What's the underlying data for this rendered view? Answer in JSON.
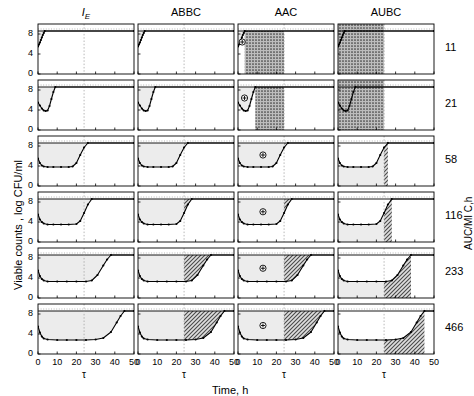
{
  "figure": {
    "axis_x_title": "Time, h",
    "axis_y_title": "Viable counts , log CFU/ml",
    "axis_right_title": "AUC/MI C,h",
    "tau_symbol": "τ",
    "tau_value": 24,
    "xlim": [
      0,
      50
    ],
    "ylim": [
      0,
      10
    ],
    "x_ticks": [
      0,
      10,
      20,
      30,
      40,
      50
    ],
    "y_ticks": [
      0,
      4,
      8
    ],
    "control_level": 8.6,
    "colors": {
      "curve": "#000000",
      "light_fill": "#ececec",
      "hatch_fill": "#a8a8a8",
      "dense_fill": "#909090",
      "axis": "#000000",
      "grid": "#9a9a9a",
      "background": "#ffffff"
    }
  },
  "columns": [
    {
      "id": "IE",
      "label": "I",
      "sub": "E",
      "italic": true,
      "metric": "intensity-of-effect"
    },
    {
      "id": "ABBC",
      "label": "ABBC",
      "sub": "",
      "italic": false,
      "metric": "area-between-bacterial-curves"
    },
    {
      "id": "AAC",
      "label": "AAC",
      "sub": "",
      "italic": false,
      "metric": "area-above-curve"
    },
    {
      "id": "AUBC",
      "label": "AUBC",
      "sub": "",
      "italic": false,
      "metric": "area-under-bacterial-curve"
    }
  ],
  "rows": [
    {
      "label": "11"
    },
    {
      "label": "21"
    },
    {
      "label": "58"
    },
    {
      "label": "116"
    },
    {
      "label": "233"
    },
    {
      "label": "466"
    }
  ],
  "chart_data": {
    "type": "line",
    "title": "",
    "xlabel": "Time, h",
    "ylabel": "Viable counts , log CFU/ml",
    "right_label": "AUC/MI C,h",
    "xlim": [
      0,
      50
    ],
    "ylim": [
      0,
      10
    ],
    "x_ticks": [
      0,
      10,
      20,
      30,
      40,
      50
    ],
    "y_ticks": [
      0,
      4,
      8
    ],
    "grid": "tau-line-only",
    "legend": "none",
    "tau": 24,
    "control_line_y": 8.6,
    "panel_columns": [
      "I_E",
      "ABBC",
      "AAC",
      "AUBC"
    ],
    "panel_rows": [
      "11",
      "21",
      "58",
      "116",
      "233",
      "466"
    ],
    "series": [
      {
        "name": "AUC/MIC 11",
        "x": [
          0,
          0.5,
          1,
          1.5,
          2,
          2.5,
          3,
          3.5,
          50
        ],
        "values": [
          5.5,
          5.9,
          6.3,
          6.8,
          7.3,
          7.8,
          8.2,
          8.6,
          8.6
        ],
        "nadir": 5.5,
        "nadir_time": 0,
        "regrowth_time": 3.5,
        "shade_start": 0,
        "shade_end": 3.5,
        "aac_end": 24,
        "aubc_end": 24
      },
      {
        "name": "AUC/MIC 21",
        "x": [
          0,
          1,
          2,
          3,
          4,
          5,
          6,
          7,
          8,
          9,
          50
        ],
        "values": [
          5.5,
          4.9,
          4.3,
          3.9,
          3.8,
          3.9,
          4.8,
          6.2,
          7.6,
          8.6,
          8.6
        ],
        "nadir": 3.8,
        "nadir_time": 4,
        "regrowth_time": 9,
        "shade_start": 0,
        "shade_end": 9,
        "aac_end": 24,
        "aubc_end": 24
      },
      {
        "name": "AUC/MIC 58",
        "x": [
          0,
          1,
          2,
          3,
          5,
          8,
          12,
          16,
          18,
          20,
          22,
          24,
          26,
          50
        ],
        "values": [
          5.5,
          4.6,
          4.1,
          3.9,
          3.8,
          3.8,
          3.8,
          3.8,
          3.9,
          4.6,
          6.2,
          7.7,
          8.6,
          8.6
        ],
        "nadir": 3.8,
        "nadir_time": 12,
        "regrowth_time": 26,
        "shade_start": 0,
        "shade_end": 26,
        "aac_end": 24,
        "aubc_end": 24
      },
      {
        "name": "AUC/MIC 116",
        "x": [
          0,
          1,
          2,
          3,
          5,
          8,
          12,
          16,
          20,
          22,
          24,
          26,
          28,
          50
        ],
        "values": [
          5.5,
          4.5,
          4.0,
          3.7,
          3.5,
          3.5,
          3.5,
          3.5,
          3.6,
          4.2,
          5.8,
          7.5,
          8.6,
          8.6
        ],
        "nadir": 3.5,
        "nadir_time": 12,
        "regrowth_time": 28,
        "shade_start": 0,
        "shade_end": 28,
        "aac_end": 24,
        "aubc_end": 24
      },
      {
        "name": "AUC/MIC 233",
        "x": [
          0,
          1,
          2,
          3,
          5,
          10,
          15,
          20,
          25,
          28,
          31,
          34,
          36,
          38,
          50
        ],
        "values": [
          5.5,
          4.4,
          3.8,
          3.5,
          3.3,
          3.3,
          3.3,
          3.3,
          3.3,
          3.5,
          4.6,
          6.5,
          7.7,
          8.6,
          8.6
        ],
        "nadir": 3.3,
        "nadir_time": 15,
        "regrowth_time": 38,
        "shade_start": 0,
        "shade_end": 38,
        "aac_end": 24,
        "aubc_end": 24
      },
      {
        "name": "AUC/MIC 466",
        "x": [
          0,
          1,
          2,
          3,
          5,
          10,
          15,
          20,
          25,
          30,
          34,
          38,
          41,
          43,
          45,
          50
        ],
        "values": [
          5.5,
          4.3,
          3.5,
          3.1,
          2.9,
          2.8,
          2.8,
          2.8,
          2.8,
          2.9,
          3.2,
          4.4,
          6.3,
          7.6,
          8.6,
          8.6
        ],
        "nadir": 2.8,
        "nadir_time": 20,
        "regrowth_time": 45,
        "shade_start": 0,
        "shade_end": 45,
        "aac_end": 24,
        "aubc_end": 24
      }
    ],
    "annotations": {
      "plus_marker": "⊕",
      "plus_marker_column": "AAC",
      "plus_marker_rows": [
        "11",
        "21",
        "58",
        "116",
        "233",
        "466"
      ]
    }
  }
}
